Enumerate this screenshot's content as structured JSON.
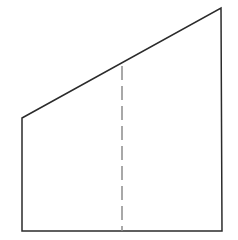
{
  "figure": {
    "name": "trapezoid-with-median-dashed-line",
    "background_color": "#ffffff",
    "canvas": {
      "width": 238,
      "height": 240
    },
    "shape": {
      "name": "right-trapezoid",
      "type": "quadrilateral",
      "stroke_color": "#2b2b2b",
      "stroke_width": 1.5,
      "fill": "none",
      "points": "22,118 221,8 222,231 22,231",
      "vertices": [
        {
          "label": "top-left",
          "x": 22,
          "y": 118
        },
        {
          "label": "top-right-apex",
          "x": 221,
          "y": 8
        },
        {
          "label": "bottom-right",
          "x": 222,
          "y": 231
        },
        {
          "label": "bottom-left",
          "x": 22,
          "y": 231
        }
      ],
      "edges": [
        {
          "name": "slanted-top-edge",
          "from": "top-left",
          "to": "top-right-apex",
          "style": "solid"
        },
        {
          "name": "right-vertical-edge",
          "from": "top-right-apex",
          "to": "bottom-right",
          "style": "solid"
        },
        {
          "name": "bottom-horizontal-edge",
          "from": "bottom-right",
          "to": "bottom-left",
          "style": "solid"
        },
        {
          "name": "left-vertical-edge",
          "from": "bottom-left",
          "to": "top-left",
          "style": "solid"
        }
      ]
    },
    "dashed_line": {
      "name": "interior-vertical-dashed-line",
      "stroke_color": "#8c8c8c",
      "stroke_width": 1.5,
      "dash_length": 14,
      "gap_length": 6,
      "x": 122,
      "y_top": 66,
      "y_bottom": 231
    }
  }
}
